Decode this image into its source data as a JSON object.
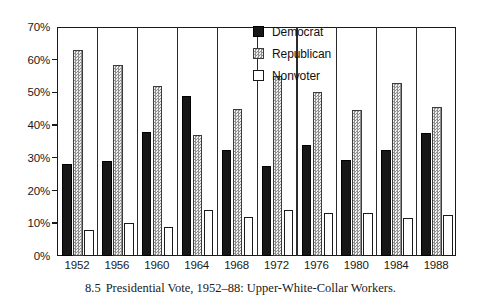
{
  "caption": {
    "number": "8.5",
    "text": "Presidential Vote, 1952–88: Upper-White-Collar Workers."
  },
  "legend": {
    "items": [
      {
        "label": "Democrat",
        "swatch": "solid-black"
      },
      {
        "label": "Republican",
        "swatch": "dotted-gray"
      },
      {
        "label": "Nonvoter",
        "swatch": "open-white"
      }
    ]
  },
  "axis": {
    "y_ticks": [
      "0%",
      "10%",
      "20%",
      "30%",
      "40%",
      "50%",
      "60%",
      "70%"
    ]
  },
  "chart_data": {
    "type": "bar",
    "title": "Presidential Vote, 1952–88: Upper-White-Collar Workers.",
    "xlabel": "",
    "ylabel": "",
    "ylim": [
      0,
      70
    ],
    "ytick_values": [
      0,
      10,
      20,
      30,
      40,
      50,
      60,
      70
    ],
    "grid": false,
    "legend_position": "top-right",
    "categories": [
      "1952",
      "1956",
      "1960",
      "1964",
      "1968",
      "1972",
      "1976",
      "1980",
      "1984",
      "1988"
    ],
    "series": [
      {
        "name": "Democrat",
        "color": "#171717",
        "values": [
          28,
          29,
          38,
          49,
          32.5,
          27.5,
          34,
          29.5,
          32.5,
          37.5
        ]
      },
      {
        "name": "Republican",
        "color": "#d2d2d2",
        "values": [
          63,
          58.5,
          52,
          37,
          45,
          55,
          50,
          44.5,
          53,
          45.5
        ]
      },
      {
        "name": "Nonvoter",
        "color": "#ffffff",
        "values": [
          8,
          10,
          9,
          14,
          12,
          14,
          13,
          13,
          11.5,
          12.5
        ]
      }
    ]
  }
}
